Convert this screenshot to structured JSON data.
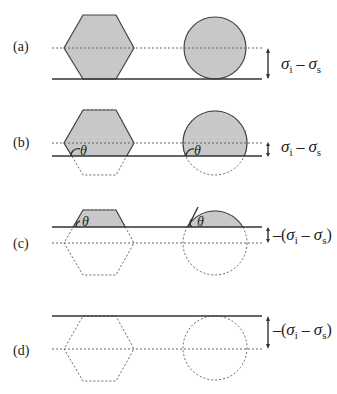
{
  "panels": [
    {
      "label": "(a)",
      "energy_label": {
        "prefix": "",
        "sigma1": "σ",
        "sub1": "i",
        "minus": " – ",
        "sigma2": "σ",
        "sub2": "s",
        "suffix": ""
      }
    },
    {
      "label": "(b)",
      "angle": "θ",
      "energy_label": {
        "prefix": "",
        "sigma1": "σ",
        "sub1": "i",
        "minus": " – ",
        "sigma2": "σ",
        "sub2": "s",
        "suffix": ""
      }
    },
    {
      "label": "(c)",
      "angle": "θ",
      "energy_label": {
        "prefix": "–(",
        "sigma1": "σ",
        "sub1": "i",
        "minus": " – ",
        "sigma2": "σ",
        "sub2": "s",
        "suffix": ")"
      }
    },
    {
      "label": "(d)",
      "energy_label": {
        "prefix": "–(",
        "sigma1": "σ",
        "sub1": "i",
        "minus": " – ",
        "sigma2": "σ",
        "sub2": "s",
        "suffix": ")"
      }
    }
  ],
  "colors": {
    "shade": "#c8c8c8",
    "line": "#333333"
  }
}
